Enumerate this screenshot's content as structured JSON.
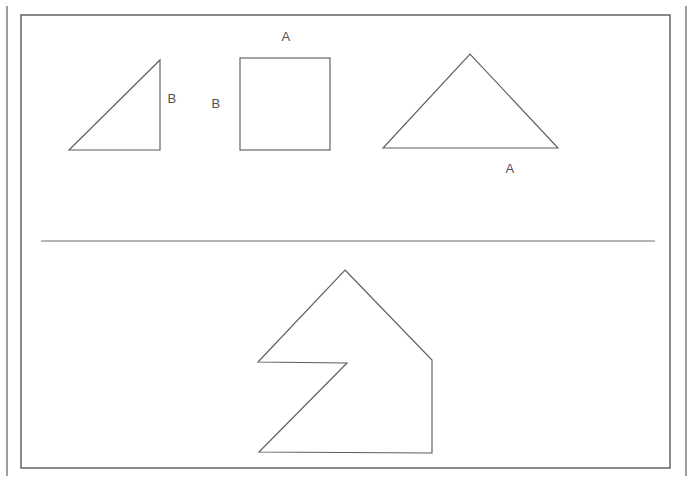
{
  "figure": {
    "background_color": "#ffffff",
    "stroke_color": "#5d5d64",
    "label_color": "#4f4f56",
    "width": 693,
    "height": 480
  },
  "frame": {
    "outer_left_rail": {
      "x": 7,
      "y1": 6,
      "y2": 476
    },
    "outer_right_rail": {
      "x": 686,
      "y1": 6,
      "y2": 476
    },
    "inner_rect": {
      "x": 21,
      "y": 15,
      "width": 649,
      "height": 453
    }
  },
  "divider": {
    "label": "section-divider",
    "x1": 41,
    "y1": 241,
    "x2": 655,
    "y2": 241
  },
  "top_section": {
    "name": "component-shapes-row",
    "shapes": [
      {
        "id": "right-triangle",
        "type": "polygon",
        "points": "69,150 160,150 160,60",
        "description": "right triangle with vertical right leg"
      },
      {
        "id": "square",
        "type": "rect",
        "x": 240,
        "y": 58,
        "width": 90,
        "height": 92,
        "description": "square"
      },
      {
        "id": "isosceles-triangle",
        "type": "polygon",
        "points": "383,148 558,148 470,54",
        "description": "large isosceles triangle"
      }
    ],
    "labels": [
      {
        "id": "label-b-right-triangle",
        "text": "B",
        "x": 172,
        "y": 100
      },
      {
        "id": "label-b-square-left",
        "text": "B",
        "x": 216,
        "y": 105
      },
      {
        "id": "label-a-square-top",
        "text": "A",
        "x": 286,
        "y": 38
      },
      {
        "id": "label-a-triangle-bottom",
        "text": "A",
        "x": 510,
        "y": 170
      }
    ]
  },
  "bottom_section": {
    "name": "composite-arrow-shape",
    "shapes": [
      {
        "id": "arrow-house-polygon",
        "type": "polygon",
        "points": "345,270 432,360 432,453 259,452 347,363 258,362",
        "description": "house/arrow composite polygon with notch"
      }
    ],
    "labels": []
  }
}
